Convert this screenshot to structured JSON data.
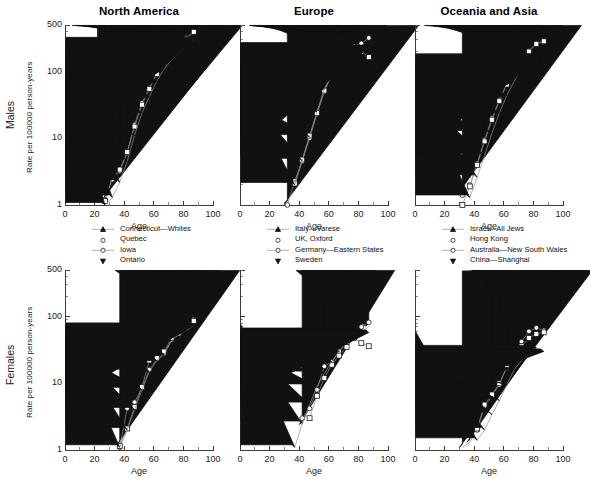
{
  "figure": {
    "row_labels": [
      "Males",
      "Females"
    ],
    "panel_titles": [
      "North America",
      "Europe",
      "Oceania and Asia"
    ],
    "y_axis_label": "Rate per 100000 person-years",
    "x_axis_label": "Age",
    "y_ticks": [
      "1",
      "10",
      "100",
      "500"
    ],
    "x_ticks": [
      "0",
      "20",
      "40",
      "60",
      "80",
      "100"
    ]
  },
  "chart_data": {
    "type": "line",
    "xlabel": "Age",
    "ylabel": "Rate per 100000 person-years",
    "yscale": "log",
    "ylim": [
      1,
      500
    ],
    "xlim": [
      0,
      100
    ],
    "grid": false,
    "legend_position": "below-panel",
    "panels": [
      {
        "row": "Males",
        "region": "North America",
        "series": [
          {
            "name": "Connecticut—Whites",
            "marker": "filled-triangle-up",
            "x": [
              22,
              27,
              32,
              37,
              42,
              47,
              52,
              57,
              62,
              67,
              72,
              77,
              82,
              87
            ],
            "y": [
              1.1,
              1.2,
              2.0,
              3.0,
              6.5,
              17,
              38,
              62,
              105,
              150,
              200,
              265,
              340,
              390
            ]
          },
          {
            "name": "Quebec",
            "marker": "open-circle",
            "x": [
              27,
              32,
              37,
              42,
              47,
              52,
              57,
              62,
              67,
              72,
              77,
              82,
              87
            ],
            "y": [
              1.2,
              2.4,
              3.2,
              6.0,
              16,
              34,
              57,
              95,
              140,
              185,
              250,
              320,
              400
            ]
          },
          {
            "name": "Iowa",
            "marker": "open-square",
            "x": [
              27,
              32,
              37,
              42,
              47,
              52,
              57,
              62,
              67,
              72,
              77,
              82,
              87
            ],
            "y": [
              1.15,
              2.6,
              3.4,
              6.2,
              15,
              32,
              55,
              92,
              135,
              180,
              245,
              310,
              395
            ]
          },
          {
            "name": "Ontario",
            "marker": "filled-triangle-down",
            "x": [
              27,
              32,
              37,
              42,
              47,
              52,
              57,
              62,
              67,
              72,
              77,
              82,
              87
            ],
            "y": [
              1.0,
              1.3,
              2.2,
              4.5,
              11,
              24,
              42,
              72,
              110,
              150,
              195,
              250,
              300
            ]
          }
        ]
      },
      {
        "row": "Males",
        "region": "Europe",
        "series": [
          {
            "name": "Italy—Varese",
            "marker": "filled-triangle-up",
            "x": [
              32,
              37,
              42,
              47,
              52,
              57,
              62,
              67,
              72,
              77,
              82,
              87
            ],
            "y": [
              1.05,
              3.2,
              7.5,
              17,
              36,
              72,
              125,
              190,
              260,
              330,
              355,
              360
            ]
          },
          {
            "name": "UK, Oxford",
            "marker": "open-circle",
            "x": [
              32,
              37,
              42,
              47,
              52,
              57,
              62,
              67,
              72,
              77,
              82,
              87
            ],
            "y": [
              1.0,
              2.3,
              4.5,
              10,
              23,
              50,
              90,
              140,
              185,
              240,
              265,
              320
            ]
          },
          {
            "name": "Germany—Eastern States",
            "marker": "open-square",
            "x": [
              37,
              42,
              47,
              52,
              57,
              62,
              67,
              72,
              77,
              82,
              87
            ],
            "y": [
              2.1,
              4.8,
              11,
              24,
              52,
              92,
              140,
              180,
              215,
              200,
              165
            ]
          },
          {
            "name": "Sweden",
            "marker": "filled-triangle-down",
            "x": [
              37,
              42,
              47,
              52,
              57,
              62,
              67,
              72,
              77,
              82,
              87
            ],
            "y": [
              2.0,
              4.6,
              10.5,
              25,
              55,
              95,
              145,
              195,
              250,
              225,
              230
            ]
          }
        ]
      },
      {
        "row": "Males",
        "region": "Oceania and Asia",
        "series": [
          {
            "name": "Israel—All Jews",
            "marker": "filled-triangle-up",
            "x": [
              32,
              37,
              42,
              47,
              52,
              57,
              62,
              67,
              72,
              77,
              82
            ],
            "y": [
              1.6,
              3.0,
              6.5,
              14,
              29,
              55,
              95,
              150,
              210,
              280,
              360
            ]
          },
          {
            "name": "Hong Kong",
            "marker": "open-circle",
            "x": [
              32,
              37,
              42,
              47,
              52,
              57,
              62,
              67,
              72,
              77,
              82,
              87
            ],
            "y": [
              1.4,
              2.0,
              4.2,
              9.5,
              20,
              38,
              66,
              105,
              150,
              205,
              265,
              280
            ]
          },
          {
            "name": "Australia—New South Wales",
            "marker": "open-square",
            "x": [
              32,
              37,
              42,
              47,
              52,
              57,
              62,
              67,
              72,
              77,
              82,
              87
            ],
            "y": [
              1.0,
              1.9,
              4.0,
              9.0,
              19,
              36,
              64,
              100,
              145,
              200,
              260,
              285
            ]
          },
          {
            "name": "China—Shanghai",
            "marker": "filled-triangle-down",
            "x": [
              37,
              42,
              47,
              52,
              57,
              62,
              67,
              72,
              77,
              82,
              87
            ],
            "y": [
              1.3,
              2.6,
              5.5,
              12,
              24,
              44,
              72,
              105,
              145,
              165,
              170
            ]
          }
        ]
      },
      {
        "row": "Females",
        "region": "North America",
        "series": [
          {
            "name": "Connecticut—Whites",
            "marker": "filled-triangle-up",
            "x": [
              37,
              42,
              47,
              52,
              57,
              62,
              67,
              72,
              77,
              82,
              87
            ],
            "y": [
              1.2,
              2.3,
              4.6,
              9.0,
              24,
              32,
              42,
              52,
              62,
              75,
              88
            ]
          },
          {
            "name": "Quebec",
            "marker": "open-circle",
            "x": [
              37,
              42,
              47,
              52,
              57,
              62,
              67,
              72,
              77,
              82,
              87
            ],
            "y": [
              1.1,
              4.2,
              5.2,
              8.5,
              16,
              23,
              28,
              45,
              55,
              70,
              90
            ]
          },
          {
            "name": "Iowa",
            "marker": "open-square",
            "x": [
              37,
              42,
              47,
              52,
              57,
              62,
              67,
              72,
              77,
              82,
              87
            ],
            "y": [
              1.15,
              2.1,
              4.4,
              8.8,
              22,
              24,
              30,
              48,
              58,
              72,
              86
            ]
          },
          {
            "name": "Ontario",
            "marker": "filled-triangle-down",
            "x": [
              37,
              42,
              47,
              52,
              57,
              62,
              67,
              72,
              77,
              82,
              87
            ],
            "y": [
              1.1,
              2.0,
              4.0,
              8.0,
              15,
              22,
              27,
              44,
              54,
              62,
              74
            ]
          }
        ]
      },
      {
        "row": "Females",
        "region": "Europe",
        "series": [
          {
            "name": "Italy—Varese",
            "marker": "filled-triangle-up",
            "x": [
              42,
              47,
              52,
              57,
              62,
              67,
              72,
              77,
              82,
              87
            ],
            "y": [
              2.4,
              4.5,
              8.5,
              15,
              20,
              28,
              36,
              48,
              56,
              72
            ]
          },
          {
            "name": "UK, Oxford",
            "marker": "open-circle",
            "x": [
              42,
              47,
              52,
              57,
              62,
              67,
              72,
              77,
              82,
              87
            ],
            "y": [
              3.0,
              4.2,
              8.0,
              18,
              21,
              30,
              40,
              58,
              70,
              82
            ]
          },
          {
            "name": "Germany—Eastern States",
            "marker": "open-square",
            "x": [
              47,
              52,
              57,
              62,
              67,
              72,
              77,
              82,
              87
            ],
            "y": [
              3.0,
              6.5,
              12,
              19,
              26,
              35,
              48,
              40,
              36
            ]
          },
          {
            "name": "Sweden",
            "marker": "filled-triangle-down",
            "x": [
              37,
              42,
              47,
              52,
              57,
              62,
              67,
              72,
              77,
              82,
              87
            ],
            "y": [
              1.1,
              2.5,
              4.8,
              9.0,
              14,
              21,
              30,
              44,
              56,
              62,
              58
            ]
          }
        ]
      },
      {
        "row": "Females",
        "region": "Oceania and Asia",
        "series": [
          {
            "name": "Israel—All Jews",
            "marker": "filled-triangle-up",
            "x": [
              32,
              37,
              42,
              47,
              52,
              57,
              62,
              67,
              72,
              77,
              82,
              87
            ],
            "y": [
              1.1,
              1.3,
              2.2,
              5.5,
              9.0,
              16,
              26,
              36,
              48,
              62,
              70,
              65
            ]
          },
          {
            "name": "Hong Kong",
            "marker": "open-circle",
            "x": [
              42,
              47,
              52,
              57,
              62,
              67,
              72,
              77,
              82,
              87
            ],
            "y": [
              2.0,
              4.5,
              6.5,
              9.5,
              18,
              30,
              42,
              60,
              68,
              62
            ]
          },
          {
            "name": "Australia—New South Wales",
            "marker": "open-square",
            "x": [
              42,
              47,
              52,
              57,
              62,
              67,
              72,
              77,
              82,
              87
            ],
            "y": [
              2.1,
              4.8,
              6.8,
              10,
              17,
              26,
              36,
              48,
              55,
              58
            ]
          },
          {
            "name": "China—Shanghai",
            "marker": "filled-triangle-down",
            "x": [
              42,
              47,
              52,
              57,
              62,
              67,
              72,
              77,
              82,
              87
            ],
            "y": [
              1.4,
              2.0,
              3.4,
              5.5,
              9.5,
              16,
              22,
              30,
              34,
              30
            ]
          }
        ]
      }
    ]
  },
  "legends": [
    {
      "panel": "North America",
      "entries": [
        {
          "label": "Connecticut—Whites",
          "marker": "filled-triangle-up",
          "line": true
        },
        {
          "label": "Quebec",
          "marker": "open-circle",
          "line": false
        },
        {
          "label": "Iowa",
          "marker": "open-circle-small",
          "line": true
        },
        {
          "label": "Ontario",
          "marker": "filled-triangle-down",
          "line": false
        }
      ]
    },
    {
      "panel": "Europe",
      "entries": [
        {
          "label": "Italy—Varese",
          "marker": "filled-triangle-up",
          "line": true
        },
        {
          "label": "UK, Oxford",
          "marker": "open-circle",
          "line": false
        },
        {
          "label": "Germany—Eastern States",
          "marker": "open-circle-small",
          "line": true
        },
        {
          "label": "Sweden",
          "marker": "filled-triangle-down",
          "line": false
        }
      ]
    },
    {
      "panel": "Oceania and Asia",
      "entries": [
        {
          "label": "Israel—All Jews",
          "marker": "filled-triangle-up",
          "line": true
        },
        {
          "label": "Hong Kong",
          "marker": "open-circle",
          "line": false
        },
        {
          "label": "Australia—New South Wales",
          "marker": "open-circle-small",
          "line": true
        },
        {
          "label": "China—Shanghai",
          "marker": "filled-triangle-down",
          "line": false
        }
      ]
    }
  ]
}
